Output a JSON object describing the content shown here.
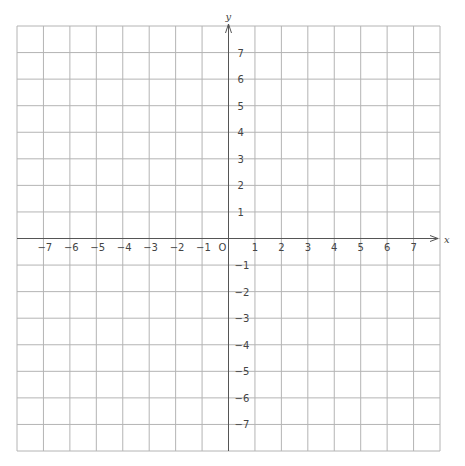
{
  "diagram": {
    "type": "coordinate-plane",
    "x_axis_label": "x",
    "y_axis_label": "y",
    "origin_label": "O",
    "x_range": [
      -8,
      8
    ],
    "y_range": [
      -8,
      8
    ],
    "grid_step": 1,
    "x_ticks": [
      {
        "value": -7,
        "label": "−7"
      },
      {
        "value": -6,
        "label": "−6"
      },
      {
        "value": -5,
        "label": "−5"
      },
      {
        "value": -4,
        "label": "−4"
      },
      {
        "value": -3,
        "label": "−3"
      },
      {
        "value": -2,
        "label": "−2"
      },
      {
        "value": -1,
        "label": "−1"
      },
      {
        "value": 1,
        "label": "1"
      },
      {
        "value": 2,
        "label": "2"
      },
      {
        "value": 3,
        "label": "3"
      },
      {
        "value": 4,
        "label": "4"
      },
      {
        "value": 5,
        "label": "5"
      },
      {
        "value": 6,
        "label": "6"
      },
      {
        "value": 7,
        "label": "7"
      }
    ],
    "y_ticks": [
      {
        "value": 7,
        "label": "7"
      },
      {
        "value": 6,
        "label": "6"
      },
      {
        "value": 5,
        "label": "5"
      },
      {
        "value": 4,
        "label": "4"
      },
      {
        "value": 3,
        "label": "3"
      },
      {
        "value": 2,
        "label": "2"
      },
      {
        "value": 1,
        "label": "1"
      },
      {
        "value": -1,
        "label": "−1"
      },
      {
        "value": -2,
        "label": "−2"
      },
      {
        "value": -3,
        "label": "−3"
      },
      {
        "value": -4,
        "label": "−4"
      },
      {
        "value": -5,
        "label": "−5"
      },
      {
        "value": -6,
        "label": "−6"
      },
      {
        "value": -7,
        "label": "−7"
      }
    ],
    "colors": {
      "grid": "#b4b4b4",
      "axis": "#555555",
      "label": "#444444",
      "background": "#ffffff"
    }
  }
}
